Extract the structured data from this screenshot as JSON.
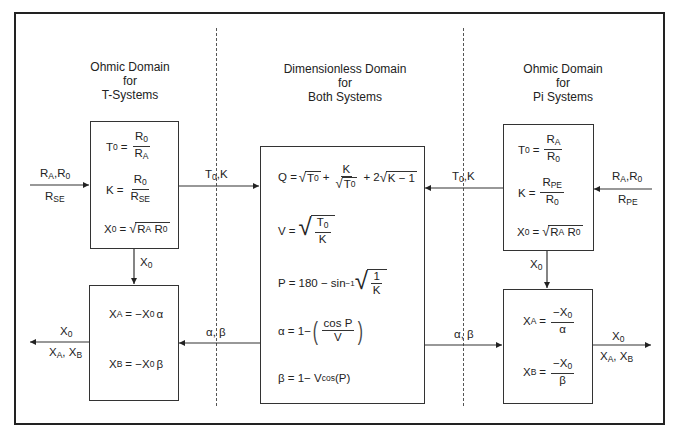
{
  "sections": {
    "left": {
      "title_lines": [
        "Ohmic Domain",
        "for",
        "T-Systems"
      ]
    },
    "center": {
      "title_lines": [
        "Dimensionless Domain",
        "for",
        "Both Systems"
      ]
    },
    "right": {
      "title_lines": [
        "Ohmic Domain",
        "for",
        "Pi Systems"
      ]
    }
  },
  "left_top_box": {
    "t0": {
      "lhs": "T",
      "lhs_sub": "0",
      "num": "R",
      "num_sub": "0",
      "den": "R",
      "den_sub": "A"
    },
    "k": {
      "lhs": "K",
      "num": "R",
      "num_sub": "0",
      "den": "R",
      "den_sub": "SE"
    },
    "x0": {
      "lhs": "X",
      "lhs_sub": "0",
      "arg1": "R",
      "arg1_sub": "A",
      "arg2": "R",
      "arg2_sub": "0"
    }
  },
  "left_bottom_box": {
    "xa": {
      "lhs": "X",
      "lhs_sub": "A",
      "rhs": "= −X",
      "rhs_sub": "0",
      "rhs_tail": "α"
    },
    "xb": {
      "lhs": "X",
      "lhs_sub": "B",
      "rhs": "= −X",
      "rhs_sub": "0",
      "rhs_tail": "β"
    }
  },
  "center_box": {
    "q": {
      "lhs": "Q =",
      "t0": "T",
      "t0_sub": "0",
      "plus": "+",
      "k": "K",
      "tail": "+ 2",
      "tail_arg": "K − 1"
    },
    "v": {
      "lhs": "V =",
      "num": "T",
      "num_sub": "0",
      "den": "K"
    },
    "p": {
      "lhs": "P = 180 − sin",
      "sup": "−1",
      "num": "1",
      "den": "K"
    },
    "alpha": {
      "lhs": "α = 1−",
      "num": "cos P",
      "den": "V"
    },
    "beta": {
      "lhs": "β = 1− V",
      "sub": "cos",
      "tail": "(P)"
    }
  },
  "right_top_box": {
    "t0": {
      "lhs": "T",
      "lhs_sub": "0",
      "num": "R",
      "num_sub": "A",
      "den": "R",
      "den_sub": "0"
    },
    "k": {
      "lhs": "K",
      "num": "R",
      "num_sub": "PE",
      "den": "R",
      "den_sub": "0"
    },
    "x0": {
      "lhs": "X",
      "lhs_sub": "0",
      "arg1": "R",
      "arg1_sub": "A",
      "arg2": "R",
      "arg2_sub": "0"
    }
  },
  "right_bottom_box": {
    "xa": {
      "lhs": "X",
      "lhs_sub": "A",
      "num": "−X",
      "num_sub": "0",
      "den": "α"
    },
    "xb": {
      "lhs": "X",
      "lhs_sub": "B",
      "num": "−X",
      "num_sub": "0",
      "den": "β"
    }
  },
  "arrow_labels": {
    "left_input_top": {
      "a": "R",
      "a_sub": "A",
      "sep": ",",
      "b": "R",
      "b_sub": "0"
    },
    "left_input_bottom": {
      "a": "R",
      "a_sub": "SE"
    },
    "left_to_center": {
      "a": "T",
      "a_sub": "0",
      "tail": ",K"
    },
    "left_down": {
      "a": "X",
      "a_sub": "0"
    },
    "center_to_left": {
      "text": "α, β"
    },
    "left_output_top": {
      "a": "X",
      "a_sub": "0"
    },
    "left_output_bottom": {
      "a": "X",
      "a_sub": "A",
      "sep": ", ",
      "b": "X",
      "b_sub": "B"
    },
    "right_input_top": {
      "a": "R",
      "a_sub": "A",
      "sep": ",",
      "b": "R",
      "b_sub": "0"
    },
    "right_input_bottom": {
      "a": "R",
      "a_sub": "PE"
    },
    "right_to_center": {
      "a": "T",
      "a_sub": "0",
      "tail": ",K"
    },
    "right_down": {
      "a": "X",
      "a_sub": "0"
    },
    "center_to_right": {
      "text": "α, β"
    },
    "right_output_top": {
      "a": "X",
      "a_sub": "0"
    },
    "right_output_bottom": {
      "a": "X",
      "a_sub": "A",
      "sep": ", ",
      "b": "X",
      "b_sub": "B"
    }
  },
  "symbols": {
    "equals": "=",
    "sqrt": "√"
  },
  "colors": {
    "line": "#333333",
    "frame": "#222222",
    "background": "#ffffff"
  }
}
